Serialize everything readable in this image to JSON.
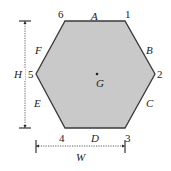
{
  "diagram": {
    "colors": {
      "fill": "#c9c9c9",
      "stroke": "#3a3a3a",
      "text": "#222222"
    },
    "vertices": [
      {
        "id": "1",
        "label": "1",
        "x": 125,
        "y": 21
      },
      {
        "id": "2",
        "label": "2",
        "x": 155,
        "y": 74
      },
      {
        "id": "3",
        "label": "3",
        "x": 125,
        "y": 128
      },
      {
        "id": "4",
        "label": "4",
        "x": 65,
        "y": 128
      },
      {
        "id": "5",
        "label": "5",
        "x": 36,
        "y": 74
      },
      {
        "id": "6",
        "label": "6",
        "x": 65,
        "y": 21
      }
    ],
    "edges": [
      {
        "id": "A",
        "label": "A",
        "from": "6",
        "to": "1"
      },
      {
        "id": "B",
        "label": "B",
        "from": "1",
        "to": "2"
      },
      {
        "id": "C",
        "label": "C",
        "from": "2",
        "to": "3"
      },
      {
        "id": "D",
        "label": "D",
        "from": "3",
        "to": "4"
      },
      {
        "id": "E",
        "label": "E",
        "from": "4",
        "to": "5"
      },
      {
        "id": "F",
        "label": "F",
        "from": "5",
        "to": "6"
      }
    ],
    "centroid": {
      "label": "G",
      "x": 97,
      "y": 74
    },
    "dimensions": {
      "height": {
        "label": "H",
        "description": "height between top edge and bottom edge"
      },
      "width": {
        "label": "W",
        "description": "width from vertex 5 to vertex 3"
      }
    }
  }
}
